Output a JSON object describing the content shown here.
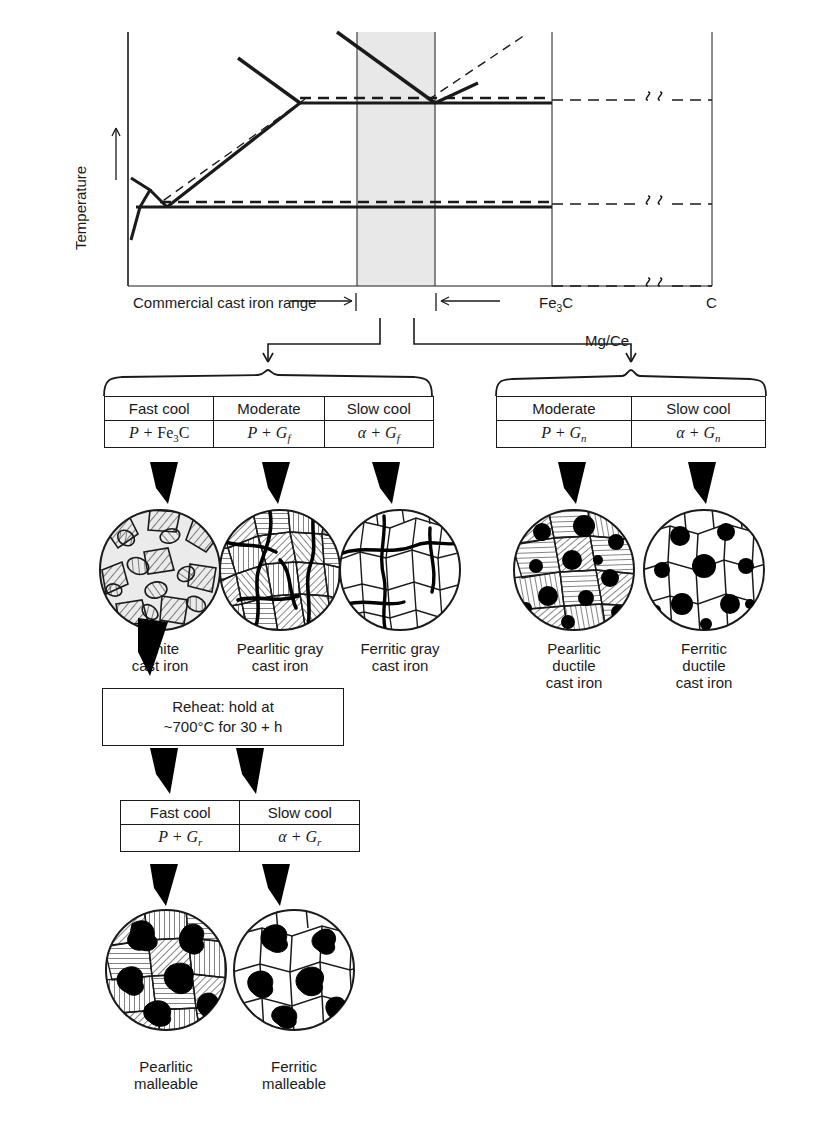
{
  "chart": {
    "ylabel": "Temperature",
    "xaxis_labels": {
      "fe3c": "Fe3C",
      "c": "C"
    },
    "range_label": "Commercial cast iron range",
    "break_symbol": "§"
  },
  "branches": {
    "mg_ce_label": "Mg/Ce"
  },
  "tables": {
    "gray_family": {
      "headers": [
        "Fast cool",
        "Moderate",
        "Slow cool"
      ],
      "products": [
        {
          "left": "P",
          "op": "+",
          "right": "Fe",
          "sub": "3",
          "tail": "C"
        },
        {
          "left": "P",
          "op": "+",
          "right": "G",
          "sub": "f",
          "tail": ""
        },
        {
          "left": "α",
          "op": "+",
          "right": "G",
          "sub": "f",
          "tail": ""
        }
      ]
    },
    "ductile_family": {
      "headers": [
        "Moderate",
        "Slow cool"
      ],
      "products": [
        {
          "left": "P",
          "op": "+",
          "right": "G",
          "sub": "n",
          "tail": ""
        },
        {
          "left": "α",
          "op": "+",
          "right": "G",
          "sub": "n",
          "tail": ""
        }
      ]
    },
    "malleable_family": {
      "headers": [
        "Fast cool",
        "Slow cool"
      ],
      "products": [
        {
          "left": "P",
          "op": "+",
          "right": "G",
          "sub": "r",
          "tail": ""
        },
        {
          "left": "α",
          "op": "+",
          "right": "G",
          "sub": "r",
          "tail": ""
        }
      ]
    }
  },
  "reheat_box": {
    "line1": "Reheat: hold at",
    "line2": "~700°C for 30 + h"
  },
  "microstructures": [
    {
      "id": "white-cast-iron",
      "caption": "White\ncast iron"
    },
    {
      "id": "pearlitic-gray",
      "caption": "Pearlitic gray\ncast iron"
    },
    {
      "id": "ferritic-gray",
      "caption": "Ferritic gray\ncast iron"
    },
    {
      "id": "pearlitic-ductile",
      "caption": "Pearlitic\nductile\ncast iron"
    },
    {
      "id": "ferritic-ductile",
      "caption": "Ferritic\nductile\ncast iron"
    },
    {
      "id": "pearlitic-malleable",
      "caption": "Pearlitic\nmalleable"
    },
    {
      "id": "ferritic-malleable",
      "caption": "Ferritic\nmalleable"
    }
  ],
  "colors": {
    "line": "#1a1a1a",
    "shaded_band": "#e8e8e8",
    "fill_light": "#ebebeb",
    "graphite_black": "#000000",
    "paper": "#ffffff"
  }
}
